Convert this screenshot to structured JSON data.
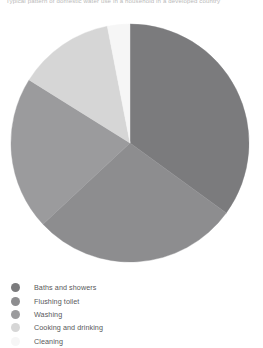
{
  "caption": {
    "text": "Typical pattern of domestic water use in a household in a developed country"
  },
  "legend": {
    "position": "bottom-left",
    "items": [
      {
        "label": "Baths and showers",
        "color": "#7b7b7d"
      },
      {
        "label": "Flushing toilet",
        "color": "#8d8d8f"
      },
      {
        "label": "Washing",
        "color": "#9b9b9d"
      },
      {
        "label": "Cooking and drinking",
        "color": "#d6d6d6"
      },
      {
        "label": "Cleaning",
        "color": "#f6f6f6"
      }
    ]
  },
  "chart_data": {
    "type": "pie",
    "title": "",
    "subtitle": "",
    "xlabel": "",
    "ylabel": "",
    "grid": false,
    "legend_position": "bottom-left",
    "start_angle_deg": 0,
    "direction": "clockwise",
    "units": "percent of domestic water use",
    "categories": [
      "Baths and showers",
      "Flushing toilet",
      "Washing",
      "Cooking and drinking",
      "Cleaning"
    ],
    "values": [
      35,
      28,
      21,
      13,
      3
    ],
    "colors": [
      "#7b7b7d",
      "#8d8d8f",
      "#9b9b9d",
      "#d6d6d6",
      "#f6f6f6"
    ],
    "slices": [
      {
        "label": "Baths and showers",
        "value": 35,
        "start_deg": 0,
        "end_deg": 126,
        "color": "#7b7b7d"
      },
      {
        "label": "Flushing toilet",
        "value": 28,
        "start_deg": 126,
        "end_deg": 227,
        "color": "#8d8d8f"
      },
      {
        "label": "Washing",
        "value": 21,
        "start_deg": 227,
        "end_deg": 302,
        "color": "#9b9b9d"
      },
      {
        "label": "Cooking and drinking",
        "value": 13,
        "start_deg": 302,
        "end_deg": 349,
        "color": "#d6d6d6"
      },
      {
        "label": "Cleaning",
        "value": 3,
        "start_deg": 349,
        "end_deg": 360,
        "color": "#f6f6f6"
      }
    ],
    "geometry": {
      "center_x": 130,
      "center_y": 143,
      "radius": 119
    }
  }
}
